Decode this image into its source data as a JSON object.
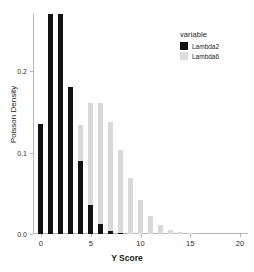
{
  "chart_data": {
    "type": "bar",
    "title": "",
    "subtitle": "",
    "xlabel": "Y Score",
    "ylabel": "Poisson Density",
    "xlim": [
      -0.8,
      20.8
    ],
    "ylim": [
      0.0,
      0.275
    ],
    "grid": false,
    "legend_position": "top-right",
    "legend_title": "variable",
    "x": [
      0,
      1,
      2,
      3,
      4,
      5,
      6,
      7,
      8,
      9,
      10,
      11,
      12,
      13,
      14,
      15,
      16,
      17,
      18,
      19,
      20
    ],
    "xticks": [
      0,
      5,
      10,
      15,
      20
    ],
    "xtick_labels": [
      "0",
      "5",
      "10",
      "15",
      "20"
    ],
    "yticks": [
      0.0,
      0.1,
      0.2
    ],
    "ytick_labels": [
      "0.0",
      "0.1",
      "0.2"
    ],
    "series": [
      {
        "name": "Lambda2",
        "color": "#121212",
        "values": [
          0.1353,
          0.2707,
          0.2707,
          0.1804,
          0.0902,
          0.0361,
          0.012,
          0.0034,
          0.0009,
          0.0002,
          0.0,
          0.0,
          0.0,
          0.0,
          0.0,
          0.0,
          0.0,
          0.0,
          0.0,
          0.0,
          0.0
        ]
      },
      {
        "name": "Lambda6",
        "color": "#d9d9d9",
        "values": [
          0.0025,
          0.0149,
          0.0446,
          0.0892,
          0.1339,
          0.1606,
          0.1606,
          0.1377,
          0.1033,
          0.0688,
          0.0413,
          0.0225,
          0.0113,
          0.0052,
          0.0022,
          0.0009,
          0.0003,
          0.0001,
          0.0,
          0.0,
          0.0
        ]
      }
    ]
  },
  "legend": {
    "title": "variable",
    "entries": [
      {
        "label": "Lambda2",
        "color": "#121212"
      },
      {
        "label": "Lambda6",
        "color": "#d9d9d9"
      }
    ]
  },
  "axes": {
    "x_title": "Y Score",
    "y_title": "Poisson Density"
  }
}
